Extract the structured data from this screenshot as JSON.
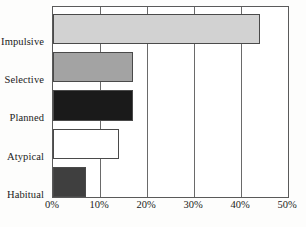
{
  "chart_data": {
    "type": "bar",
    "orientation": "horizontal",
    "title": "",
    "subtitle": "",
    "xlabel": "",
    "ylabel": "",
    "categories": [
      "Impulsive",
      "Selective",
      "Planned",
      "Atypical",
      "Habitual"
    ],
    "values": [
      44,
      17,
      17,
      14,
      7
    ],
    "value_labels": [
      "44%",
      "17%",
      "17%",
      "14%",
      "7%"
    ],
    "series": [
      {
        "name": "Percent",
        "values": [
          44,
          17,
          17,
          14,
          7
        ]
      }
    ],
    "bar_colors": [
      "#d2d2d2",
      "#a3a3a3",
      "#1a1a1a",
      "#ffffff",
      "#3f3f3f"
    ],
    "bar_border_color": "#4a4a4a",
    "xlim": [
      0,
      50
    ],
    "tick_values": [
      0,
      10,
      20,
      30,
      40,
      50
    ],
    "tick_labels": [
      "0%",
      "10%",
      "20%",
      "30%",
      "40%",
      "50%"
    ],
    "grid": true,
    "grid_axis": "x",
    "gridline_color": "#6a6a6a",
    "legend": false,
    "legend_position": "none",
    "frame_color": "#5a5a5a",
    "background_color": "#ffffff",
    "text_color": "#1b1b1b"
  }
}
